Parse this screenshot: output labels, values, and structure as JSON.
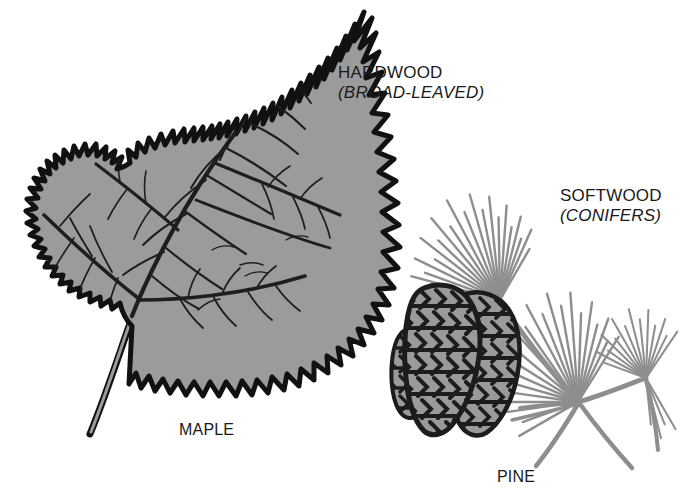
{
  "figure": {
    "background_color": "#ffffff",
    "width": 683,
    "height": 500
  },
  "palette": {
    "ink": "#1a1a1a",
    "outline": "#111111",
    "leaf_fill": "#9b9b9b",
    "leaf_vein": "#1e1e1e",
    "needle_gray": "#8e8e8e",
    "cone_fill": "#9a9a9a",
    "cone_scale_outline": "#1c1c1c",
    "background": "#ffffff"
  },
  "captions": {
    "hardwood": {
      "line1": "HARDWOOD",
      "line2": "(BROAD-LEAVED)"
    },
    "softwood": {
      "line1": "SOFTWOOD",
      "line2": "(CONIFERS)"
    }
  },
  "specimens": {
    "maple": {
      "label": "MAPLE",
      "icon": "maple-leaf-icon"
    },
    "pine": {
      "label": "PINE",
      "icon": "pine-cone-icon"
    }
  }
}
